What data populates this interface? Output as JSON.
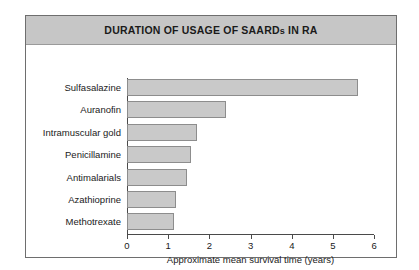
{
  "figure": {
    "title": "DURATION OF USAGE OF SAARDs IN RA",
    "title_main": "DURATION OF USAGE OF SAARD",
    "title_sub": "s",
    "title_tail": " IN RA",
    "title_band_color": "#c6c6c6",
    "frame_color": "#6e6e6e",
    "bar_fill_color": "#c9c9c9",
    "bar_border_color": "#8d8d8d",
    "axis_color": "#4a4a4a",
    "plot_background": "#ffffff"
  },
  "chart_data": {
    "type": "bar",
    "orientation": "horizontal",
    "title": "DURATION OF USAGE OF SAARDs IN RA",
    "xlabel": "Approximate mean survival time (years)",
    "ylabel": "",
    "categories": [
      "Sulfasalazine",
      "Auranofin",
      "Intramuscular gold",
      "Penicillamine",
      "Antimalarials",
      "Azathioprine",
      "Methotrexate"
    ],
    "values": [
      5.6,
      2.4,
      1.7,
      1.55,
      1.45,
      1.2,
      1.15
    ],
    "xlim": [
      0,
      6
    ],
    "xticks": [
      0,
      1,
      2,
      3,
      4,
      5,
      6
    ],
    "xtick_labels": [
      "0",
      "1",
      "2",
      "3",
      "4",
      "5",
      "6"
    ],
    "grid": false,
    "legend": null
  }
}
